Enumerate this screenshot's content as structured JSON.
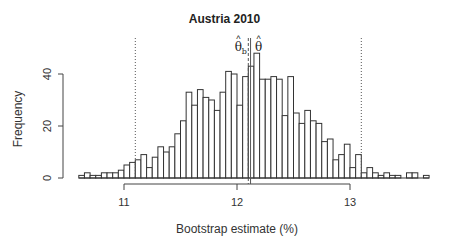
{
  "chart_data": {
    "type": "bar",
    "subtype": "histogram",
    "title": "Austria 2010",
    "xlabel": "Bootstrap estimate (%)",
    "ylabel": "Frequency",
    "x_ticks": [
      11,
      12,
      13
    ],
    "y_ticks": [
      0,
      20,
      40
    ],
    "xlim": [
      10.6,
      13.7
    ],
    "ylim": [
      0,
      48
    ],
    "bin_start": 10.6,
    "bin_width": 0.05,
    "values": [
      1,
      2,
      1,
      1,
      2,
      2,
      2,
      3,
      5,
      6,
      7,
      9,
      4,
      8,
      12,
      10,
      12,
      17,
      22,
      33,
      28,
      34,
      31,
      30,
      26,
      33,
      41,
      40,
      28,
      39,
      43,
      48,
      38,
      38,
      39,
      38,
      24,
      39,
      25,
      21,
      26,
      22,
      21,
      14,
      15,
      7,
      9,
      13,
      4,
      9,
      2,
      4,
      2,
      1,
      2,
      1,
      1,
      0,
      2,
      2,
      0,
      1
    ],
    "reference_lines": [
      {
        "label": "lower CI",
        "x": 11.1,
        "style": "dotted"
      },
      {
        "label": "upper CI",
        "x": 13.1,
        "style": "dotted"
      },
      {
        "label": "θ̂_b",
        "x": 12.1,
        "style": "dashed"
      },
      {
        "label": "θ̂",
        "x": 12.12,
        "style": "solid"
      }
    ],
    "annotations": [
      "θ̂b",
      "θ̂"
    ],
    "grid": false
  },
  "labels": {
    "title": "Austria 2010",
    "xlabel": "Bootstrap estimate (%)",
    "ylabel": "Frequency",
    "theta_b": "θ̂",
    "theta_b_sub": "b",
    "theta": "θ̂"
  }
}
